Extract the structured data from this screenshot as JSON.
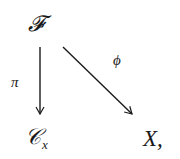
{
  "diagram": {
    "type": "commutative-diagram",
    "nodes": {
      "top": "𝓕",
      "bottom_left": {
        "base": "𝒞",
        "subscript": "x"
      },
      "bottom_right": "X,"
    },
    "arrows": [
      {
        "from": "top",
        "to": "bottom_left",
        "label": "π",
        "direction": "down"
      },
      {
        "from": "top",
        "to": "bottom_right",
        "label": "ϕ",
        "direction": "diagonal"
      }
    ],
    "colors": {
      "ink": "#1a1a1a",
      "background": "#ffffff"
    }
  }
}
